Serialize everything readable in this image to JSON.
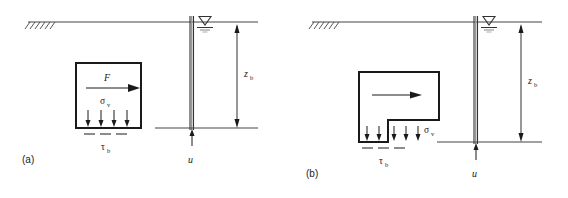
{
  "figure": {
    "panels": [
      {
        "id": "a",
        "caption": "(a)",
        "block_shape": "rectangle",
        "labels": {
          "force": "F",
          "vertical_stress": "σ",
          "vertical_stress_sub": "v",
          "base_shear": "τ",
          "base_shear_sub": "b",
          "depth": "z",
          "depth_sub": "b",
          "pore_pressure": "u"
        },
        "ground_hatch_marks": 6,
        "base_arrows": 4,
        "shear_dashes": 3
      },
      {
        "id": "b",
        "caption": "(b)",
        "block_shape": "notched-rectangle",
        "labels": {
          "force": "",
          "vertical_stress": "σ",
          "vertical_stress_sub": "v",
          "base_shear": "τ",
          "base_shear_sub": "b",
          "depth": "z",
          "depth_sub": "b",
          "pore_pressure": "u"
        },
        "ground_hatch_marks": 6,
        "base_arrows_left": 2,
        "base_arrows_right": 3,
        "shear_dashes": 3
      }
    ],
    "symbols": {
      "water_table": "water-table-triangle",
      "ground_surface": "ground-line",
      "pile": "vertical-double-line"
    },
    "colors": {
      "line": "#1a1a1a",
      "thin_line": "#555555",
      "background": "#ffffff"
    }
  }
}
